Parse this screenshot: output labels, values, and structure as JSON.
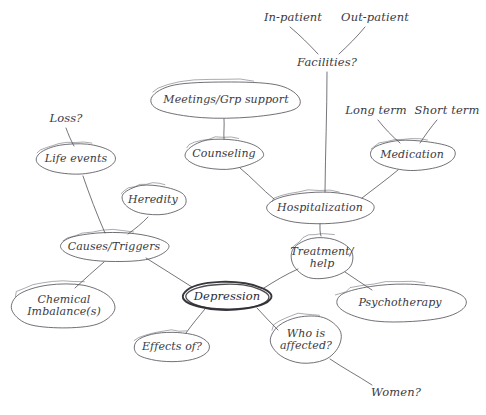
{
  "diagram": {
    "style": "hand-drawn pencil sketch",
    "ink_color": "#4a4a52",
    "emphasis_color": "#2b2b31",
    "background_color": "#ffffff"
  },
  "nodes": [
    {
      "id": "depression",
      "label": "Depression",
      "cx": 227,
      "cy": 296,
      "rx": 44,
      "ry": 14,
      "shape": "ellipse",
      "emphasis": true
    },
    {
      "id": "causes-triggers",
      "label": "Causes/Triggers",
      "cx": 114,
      "cy": 247,
      "rx": 54,
      "ry": 15,
      "shape": "ellipse",
      "emphasis": false
    },
    {
      "id": "life-events",
      "label": "Life events",
      "cx": 76,
      "cy": 159,
      "rx": 41,
      "ry": 15,
      "shape": "rounded-blob",
      "emphasis": false
    },
    {
      "id": "heredity",
      "label": "Heredity",
      "cx": 153,
      "cy": 200,
      "rx": 32,
      "ry": 15,
      "shape": "cloud-blob",
      "emphasis": false
    },
    {
      "id": "chemical",
      "label": "Chemical\nImbalance(s)",
      "cx": 64,
      "cy": 306,
      "rx": 53,
      "ry": 23,
      "shape": "rounded-blob",
      "emphasis": false
    },
    {
      "id": "effects-of",
      "label": "Effects of?",
      "cx": 172,
      "cy": 347,
      "rx": 38,
      "ry": 15,
      "shape": "ellipse",
      "emphasis": false
    },
    {
      "id": "who-affected",
      "label": "Who is\naffected?",
      "cx": 306,
      "cy": 340,
      "rx": 36,
      "ry": 24,
      "shape": "rounded-blob",
      "emphasis": false
    },
    {
      "id": "treatment-help",
      "label": "Treatment/\nhelp",
      "cx": 322,
      "cy": 258,
      "rx": 32,
      "ry": 22,
      "shape": "cloud-blob",
      "emphasis": false
    },
    {
      "id": "hospitalization",
      "label": "Hospitalization",
      "cx": 320,
      "cy": 208,
      "rx": 53,
      "ry": 16,
      "shape": "ellipse",
      "emphasis": false
    },
    {
      "id": "counseling",
      "label": "Counseling",
      "cx": 224,
      "cy": 154,
      "rx": 39,
      "ry": 15,
      "shape": "rounded-blob",
      "emphasis": false
    },
    {
      "id": "meetings",
      "label": "Meetings/Grp support",
      "cx": 226,
      "cy": 100,
      "rx": 76,
      "ry": 19,
      "shape": "rounded-blob",
      "emphasis": false
    },
    {
      "id": "medication",
      "label": "Medication",
      "cx": 412,
      "cy": 155,
      "rx": 43,
      "ry": 15,
      "shape": "rounded-blob",
      "emphasis": false
    },
    {
      "id": "psychotherapy",
      "label": "Psychotherapy",
      "cx": 400,
      "cy": 303,
      "rx": 65,
      "ry": 19,
      "shape": "ellipse",
      "emphasis": false
    }
  ],
  "free_labels": [
    {
      "id": "loss",
      "label": "Loss?",
      "x": 66,
      "y": 118
    },
    {
      "id": "in-patient",
      "label": "In-patient",
      "x": 293,
      "y": 17
    },
    {
      "id": "out-patient",
      "label": "Out-patient",
      "x": 375,
      "y": 17
    },
    {
      "id": "facilities",
      "label": "Facilities?",
      "x": 327,
      "y": 62
    },
    {
      "id": "long-term",
      "label": "Long term",
      "x": 376,
      "y": 110
    },
    {
      "id": "short-term",
      "label": "Short term",
      "x": 447,
      "y": 110
    },
    {
      "id": "women",
      "label": "Women?",
      "x": 396,
      "y": 392
    }
  ],
  "connections": [
    {
      "from": "loss",
      "to": "life-events",
      "x1": 66,
      "y1": 128,
      "x2": 74,
      "y2": 146
    },
    {
      "from": "life-events",
      "to": "causes-triggers",
      "x1": 83,
      "y1": 176,
      "x2": 105,
      "y2": 233
    },
    {
      "from": "heredity",
      "to": "causes-triggers",
      "x1": 148,
      "y1": 217,
      "x2": 128,
      "y2": 234
    },
    {
      "from": "causes-triggers",
      "to": "chemical",
      "x1": 104,
      "y1": 262,
      "x2": 75,
      "y2": 288
    },
    {
      "from": "causes-triggers",
      "to": "depression",
      "x1": 146,
      "y1": 258,
      "x2": 192,
      "y2": 287
    },
    {
      "from": "depression",
      "to": "effects-of",
      "x1": 205,
      "y1": 309,
      "x2": 186,
      "y2": 333
    },
    {
      "from": "depression",
      "to": "who-affected",
      "x1": 257,
      "y1": 308,
      "x2": 278,
      "y2": 330
    },
    {
      "from": "depression",
      "to": "treatment-help",
      "x1": 264,
      "y1": 288,
      "x2": 298,
      "y2": 269
    },
    {
      "from": "who-affected",
      "to": "women",
      "x1": 330,
      "y1": 359,
      "x2": 372,
      "y2": 385
    },
    {
      "from": "treatment-help",
      "to": "psychotherapy",
      "x1": 345,
      "y1": 272,
      "x2": 372,
      "y2": 290
    },
    {
      "from": "treatment-help",
      "to": "hospitalization",
      "x1": 321,
      "y1": 236,
      "x2": 320,
      "y2": 224
    },
    {
      "from": "hospitalization",
      "to": "counseling",
      "x1": 274,
      "y1": 199,
      "x2": 240,
      "y2": 168
    },
    {
      "from": "counseling",
      "to": "meetings",
      "x1": 224,
      "y1": 139,
      "x2": 224,
      "y2": 119
    },
    {
      "from": "hospitalization",
      "to": "medication",
      "x1": 362,
      "y1": 198,
      "x2": 398,
      "y2": 170
    },
    {
      "from": "facilities",
      "to": "hospitalization",
      "x1": 327,
      "y1": 72,
      "x2": 325,
      "y2": 192
    },
    {
      "from": "in-patient",
      "to": "facilities",
      "x1": 290,
      "y1": 27,
      "x2": 318,
      "y2": 54
    },
    {
      "from": "out-patient",
      "to": "facilities",
      "x1": 365,
      "y1": 27,
      "x2": 339,
      "y2": 54
    },
    {
      "from": "long-term",
      "to": "medication",
      "x1": 378,
      "y1": 120,
      "x2": 400,
      "y2": 143
    },
    {
      "from": "short-term",
      "to": "medication",
      "x1": 437,
      "y1": 120,
      "x2": 420,
      "y2": 143
    }
  ]
}
